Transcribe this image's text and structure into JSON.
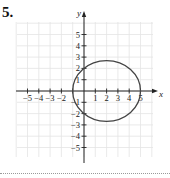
{
  "problem": {
    "number": "5."
  },
  "chart_data": {
    "type": "line",
    "title": "",
    "xlabel": "x",
    "ylabel": "y",
    "xlim": [
      -6,
      6
    ],
    "ylim": [
      -6,
      6
    ],
    "grid": true,
    "x_ticks": [
      -5,
      -4,
      -3,
      -2,
      -1,
      1,
      2,
      3,
      4,
      5
    ],
    "x_tick_labels": [
      "−5",
      "−4",
      "−3",
      "−2",
      "−1",
      "1",
      "2",
      "3",
      "4",
      "5"
    ],
    "y_ticks": [
      5,
      4,
      3,
      2,
      1,
      -1,
      -2,
      -3,
      -4,
      -5
    ],
    "y_tick_labels": [
      "5",
      "4",
      "3",
      "2",
      "1",
      "−1",
      "−2",
      "−3",
      "−4",
      "−5"
    ],
    "series": [
      {
        "name": "ellipse",
        "shape": "ellipse",
        "center": [
          2,
          0
        ],
        "semi_axis_x": 3,
        "semi_axis_y": 2.68,
        "equation": "(x-2)^2/9 + y^2/7.2 = 1",
        "key_points": [
          [
            -1,
            0
          ],
          [
            5,
            0
          ],
          [
            0,
            2
          ],
          [
            0,
            -2
          ],
          [
            2,
            2.68
          ],
          [
            2,
            -2.68
          ]
        ]
      }
    ]
  }
}
